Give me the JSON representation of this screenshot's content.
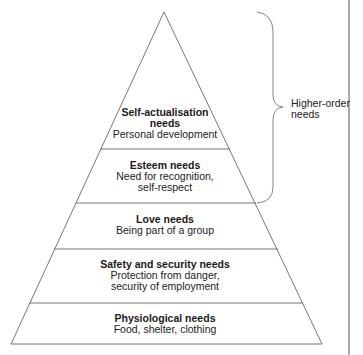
{
  "diagram": {
    "type": "pyramid",
    "levels": [
      {
        "title": "Self-actualisation needs",
        "title_lines": [
          "Self-actualisation",
          "needs"
        ],
        "description_lines": [
          "Personal development"
        ]
      },
      {
        "title": "Esteem needs",
        "title_lines": [
          "Esteem needs"
        ],
        "description_lines": [
          "Need for recognition,",
          "self-respect"
        ]
      },
      {
        "title": "Love needs",
        "title_lines": [
          "Love needs"
        ],
        "description_lines": [
          "Being part of a group"
        ]
      },
      {
        "title": "Safety and security needs",
        "title_lines": [
          "Safety and security needs"
        ],
        "description_lines": [
          "Protection from danger,",
          "security of employment"
        ]
      },
      {
        "title": "Physiological needs",
        "title_lines": [
          "Physiological needs"
        ],
        "description_lines": [
          "Food, shelter, clothing"
        ]
      }
    ],
    "brace": {
      "label_lines": [
        "Higher-order",
        "needs"
      ],
      "spans_levels": [
        "Self-actualisation needs",
        "Esteem needs"
      ]
    },
    "colors": {
      "line": "#555555",
      "text": "#1a1a1a",
      "background": "#ffffff"
    }
  }
}
